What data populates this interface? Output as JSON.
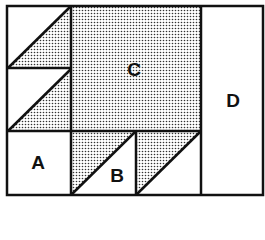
{
  "diagram": {
    "type": "quilt-block-layout",
    "labels": {
      "A": "A",
      "B": "B",
      "C": "C",
      "D": "D"
    },
    "colors": {
      "stroke": "#111111",
      "dots": "#333333",
      "fill": "#ffffff"
    }
  }
}
